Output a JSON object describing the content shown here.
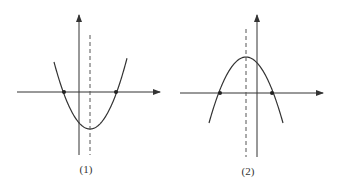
{
  "figure": {
    "width": 339,
    "height": 188,
    "stroke_color": "#333333",
    "background": "#ffffff"
  },
  "graphs": [
    {
      "id": "graph-1",
      "label": "(1)",
      "label_pos": {
        "x": 86,
        "y": 163
      },
      "opens": "up",
      "x_axis": {
        "y": 92,
        "x1": 17,
        "x2": 160
      },
      "y_axis": {
        "x": 79,
        "y1": 15,
        "y2": 155
      },
      "axis_of_symmetry": {
        "x": 90,
        "y1": 35,
        "y2": 155,
        "style": "dashed"
      },
      "vertex": {
        "x": 90,
        "y": 129
      },
      "roots": [
        {
          "x": 64,
          "y": 92
        },
        {
          "x": 116,
          "y": 92
        }
      ],
      "curve_ends": [
        {
          "x": 54,
          "y": 62
        },
        {
          "x": 127,
          "y": 62
        }
      ]
    },
    {
      "id": "graph-2",
      "label": "(2)",
      "label_pos": {
        "x": 248,
        "y": 165
      },
      "opens": "down",
      "x_axis": {
        "y": 93,
        "x1": 180,
        "x2": 323
      },
      "y_axis": {
        "x": 257,
        "y1": 15,
        "y2": 157
      },
      "axis_of_symmetry": {
        "x": 246,
        "y1": 29,
        "y2": 157,
        "style": "dashed"
      },
      "vertex": {
        "x": 246,
        "y": 57
      },
      "roots": [
        {
          "x": 220,
          "y": 93
        },
        {
          "x": 272,
          "y": 93
        }
      ],
      "curve_ends": [
        {
          "x": 209,
          "y": 123
        },
        {
          "x": 283,
          "y": 123
        }
      ]
    }
  ]
}
